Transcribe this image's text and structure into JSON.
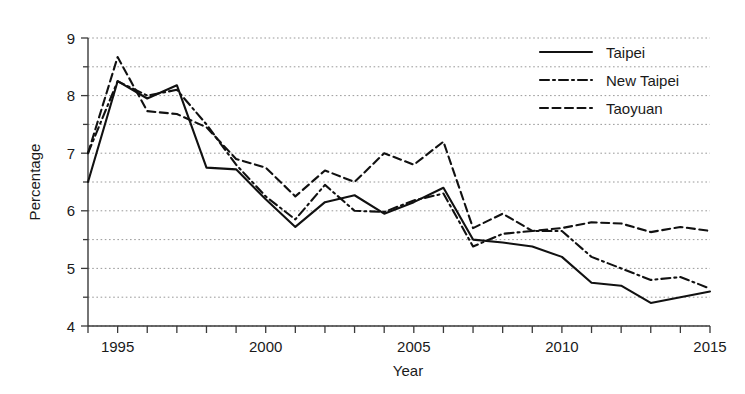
{
  "chart_data": {
    "type": "line",
    "title": "",
    "xlabel": "Year",
    "ylabel": "Percentage",
    "xlim": [
      1994,
      2015
    ],
    "ylim": [
      4,
      9
    ],
    "grid": true,
    "grid_axis": "y",
    "grid_interval": 0.5,
    "y_major_ticks": [
      4,
      5,
      6,
      7,
      8,
      9
    ],
    "y_tick_labels": [
      "4",
      "5",
      "6",
      "7",
      "8",
      "9"
    ],
    "y_minor_ticks": [
      4.5,
      5.5,
      6.5,
      7.5,
      8.5
    ],
    "x_ticks": [
      1994,
      1995,
      1996,
      1997,
      1998,
      1999,
      2000,
      2001,
      2002,
      2003,
      2004,
      2005,
      2006,
      2007,
      2008,
      2009,
      2010,
      2011,
      2012,
      2013,
      2014,
      2015
    ],
    "x_tick_labels_shown": [
      "1995",
      "2000",
      "2005",
      "2010",
      "2015"
    ],
    "x_tick_labels_shown_values": [
      1995,
      2000,
      2005,
      2010,
      2015
    ],
    "legend_position": "top-right",
    "x": [
      1994,
      1995,
      1996,
      1997,
      1998,
      1999,
      2000,
      2001,
      2002,
      2003,
      2004,
      2005,
      2006,
      2007,
      2008,
      2009,
      2010,
      2011,
      2012,
      2013,
      2014,
      2015
    ],
    "series": [
      {
        "name": "Taipei",
        "style": "solid",
        "color": "#111111",
        "values": [
          6.5,
          8.25,
          7.95,
          8.18,
          6.75,
          6.72,
          6.2,
          5.72,
          6.15,
          6.27,
          5.95,
          6.15,
          6.4,
          5.5,
          5.45,
          5.38,
          5.2,
          4.75,
          4.7,
          4.4,
          4.5,
          4.6
        ]
      },
      {
        "name": "New Taipei",
        "style": "dash-dot",
        "color": "#111111",
        "values": [
          7.0,
          8.25,
          8.0,
          8.1,
          7.5,
          6.8,
          6.25,
          5.85,
          6.45,
          6.0,
          5.98,
          6.18,
          6.3,
          5.38,
          5.6,
          5.65,
          5.65,
          5.2,
          5.0,
          4.8,
          4.85,
          4.65
        ]
      },
      {
        "name": "Taoyuan",
        "style": "dashed",
        "color": "#111111",
        "values": [
          7.0,
          8.67,
          7.73,
          7.68,
          7.45,
          6.9,
          6.75,
          6.25,
          6.7,
          6.5,
          7.0,
          6.8,
          7.2,
          5.7,
          5.95,
          5.65,
          5.7,
          5.8,
          5.78,
          5.63,
          5.72,
          5.65
        ]
      }
    ]
  },
  "legend": {
    "items": [
      {
        "label": "Taipei"
      },
      {
        "label": "New Taipei"
      },
      {
        "label": "Taoyuan"
      }
    ]
  },
  "axes": {
    "x_title": "Year",
    "y_title": "Percentage"
  }
}
